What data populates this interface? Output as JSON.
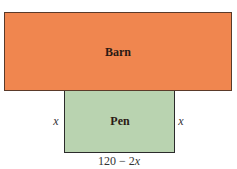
{
  "diagram": {
    "barn": {
      "label": "Barn",
      "color": "#f0864f"
    },
    "pen": {
      "label": "Pen",
      "color": "#b9d3b0"
    },
    "side_left": "x",
    "side_right": "x",
    "bottom": {
      "prefix": "120 − 2",
      "var": "x"
    }
  }
}
